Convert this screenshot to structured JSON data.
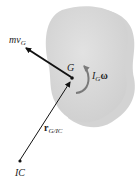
{
  "diagram": {
    "labels": {
      "momentum": "mv",
      "momentum_sub": "G",
      "center": "G",
      "angular": "I",
      "angular_sub": "G",
      "angular_omega": "ω",
      "position": "r",
      "position_sub": "G/IC",
      "ic": "IC"
    },
    "colors": {
      "body": "#d6d6d6",
      "shadow": "#c4c4c4",
      "arrow": "#111111",
      "angular_arrow": "#7a7a7a"
    }
  }
}
